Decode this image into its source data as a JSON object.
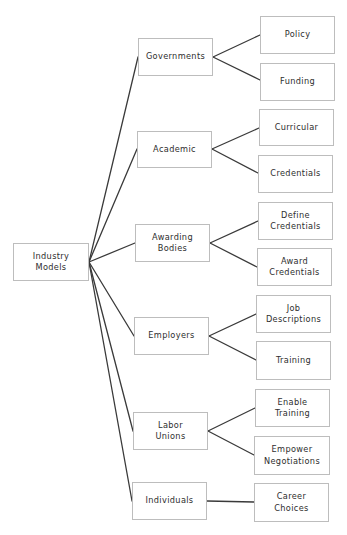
{
  "diagram": {
    "type": "tree",
    "edge_color": "#3a3a3a",
    "border_color": "#bdbdbd",
    "root": {
      "id": "industry-models",
      "label": "Industry\nModels",
      "box": [
        13,
        243,
        76,
        38
      ]
    },
    "branches": [
      {
        "id": "governments",
        "label": "Governments",
        "box": [
          138,
          38,
          75,
          38
        ],
        "children": [
          {
            "id": "policy",
            "label": "Policy",
            "box": [
              260,
              16,
              75,
              38
            ]
          },
          {
            "id": "funding",
            "label": "Funding",
            "box": [
              260,
              63,
              75,
              38
            ]
          }
        ]
      },
      {
        "id": "academic",
        "label": "Academic",
        "box": [
          137,
          131,
          75,
          37
        ],
        "children": [
          {
            "id": "curricular",
            "label": "Curricular",
            "box": [
              259,
              109,
              75,
              37
            ]
          },
          {
            "id": "credentials",
            "label": "Credentials",
            "box": [
              258,
              155,
              75,
              38
            ]
          }
        ]
      },
      {
        "id": "awarding-bodies",
        "label": "Awarding\nBodies",
        "box": [
          135,
          224,
          75,
          38
        ],
        "children": [
          {
            "id": "define-credentials",
            "label": "Define\nCredentials",
            "box": [
              258,
              202,
              75,
              38
            ]
          },
          {
            "id": "award-credentials",
            "label": "Award\nCredentials",
            "box": [
              257,
              248,
              75,
              38
            ]
          }
        ]
      },
      {
        "id": "employers",
        "label": "Employers",
        "box": [
          134,
          317,
          75,
          38
        ],
        "children": [
          {
            "id": "job-descriptions",
            "label": "Job\nDescriptions",
            "box": [
              256,
              295,
              75,
              38
            ]
          },
          {
            "id": "training",
            "label": "Training",
            "box": [
              256,
              341,
              75,
              39
            ]
          }
        ]
      },
      {
        "id": "labor-unions",
        "label": "Labor\nUnions",
        "box": [
          133,
          412,
          75,
          38
        ],
        "children": [
          {
            "id": "enable-training",
            "label": "Enable\nTraining",
            "box": [
              255,
              389,
              75,
              38
            ]
          },
          {
            "id": "empower-negotiations",
            "label": "Empower\nNegotiations",
            "box": [
              254,
              436,
              76,
              39
            ]
          }
        ]
      },
      {
        "id": "individuals",
        "label": "Individuals",
        "box": [
          132,
          482,
          75,
          38
        ],
        "children": [
          {
            "id": "career-choices",
            "label": "Career\nChoices",
            "box": [
              254,
              483,
              75,
              39
            ]
          }
        ]
      }
    ]
  },
  "labels": {
    "root": "Industry\nModels",
    "governments": "Governments",
    "policy": "Policy",
    "funding": "Funding",
    "academic": "Academic",
    "curricular": "Curricular",
    "credentials": "Credentials",
    "awarding_bodies": "Awarding\nBodies",
    "define_credentials": "Define\nCredentials",
    "award_credentials": "Award\nCredentials",
    "employers": "Employers",
    "job_descriptions": "Job\nDescriptions",
    "training": "Training",
    "labor_unions": "Labor\nUnions",
    "enable_training": "Enable\nTraining",
    "empower_negotiations": "Empower\nNegotiations",
    "individuals": "Individuals",
    "career_choices": "Career\nChoices"
  }
}
